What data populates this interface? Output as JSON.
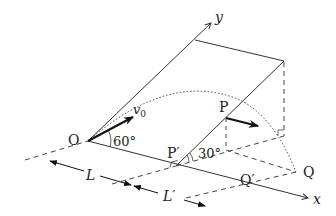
{
  "diagram": {
    "type": "projectile on inclined plane (3D perspective)",
    "labels": {
      "origin": "O",
      "x_axis": "x",
      "y_axis": "y",
      "velocity": "v",
      "velocity_sub": "0",
      "launch_angle": "60°",
      "incline_angle": "30°",
      "point_P": "P",
      "point_P_foot": "P′",
      "point_Q": "Q",
      "point_Q_proj": "Q′",
      "dist_L": "L",
      "dist_L_prime": "L′"
    },
    "colors": {
      "line": "#333333",
      "dashed": "#444444",
      "arrow": "#111111"
    }
  }
}
